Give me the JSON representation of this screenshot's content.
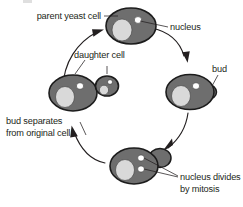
{
  "diagram": {
    "type": "cycle-diagram",
    "background_color": "#ffffff",
    "palette": {
      "cell_fill": "#6e6e6e",
      "cell_outline": "#1c1c1c",
      "vacuole_fill": "#d9d9d9",
      "nucleus_fill": "#ffffff",
      "text_color": "#231f20",
      "arrow_color": "#231f20"
    },
    "labels": {
      "parent_yeast_cell": "parent yeast cell",
      "nucleus": "nucleus",
      "bud": "bud",
      "nucleus_divides_line1": "nucleus divides",
      "nucleus_divides_line2": "by mitosis",
      "bud_separates_line1": "bud separates",
      "bud_separates_line2": "from original cell",
      "daughter_cell": "daughter cell"
    },
    "stages": [
      {
        "id": "stage-parent",
        "name": "parent yeast cell",
        "position": "top",
        "nuclei": 1,
        "has_bud": false
      },
      {
        "id": "stage-budding",
        "name": "bud forms",
        "position": "right",
        "nuclei": 1,
        "has_bud": true
      },
      {
        "id": "stage-mitosis",
        "name": "nucleus divides by mitosis",
        "position": "bottom",
        "nuclei": 2,
        "has_bud": true
      },
      {
        "id": "stage-separation",
        "name": "bud separates from original cell",
        "position": "left",
        "nuclei": 1,
        "has_bud": false,
        "daughter_cell": true
      }
    ],
    "cycle_arrows": [
      {
        "id": "arrow-parent-to-bud",
        "from": "stage-parent",
        "to": "stage-budding"
      },
      {
        "id": "arrow-bud-to-mitosis",
        "from": "stage-budding",
        "to": "stage-mitosis"
      },
      {
        "id": "arrow-mitosis-to-separation",
        "from": "stage-mitosis",
        "to": "stage-separation"
      },
      {
        "id": "arrow-separation-to-parent",
        "from": "stage-separation",
        "to": "stage-parent"
      }
    ]
  }
}
